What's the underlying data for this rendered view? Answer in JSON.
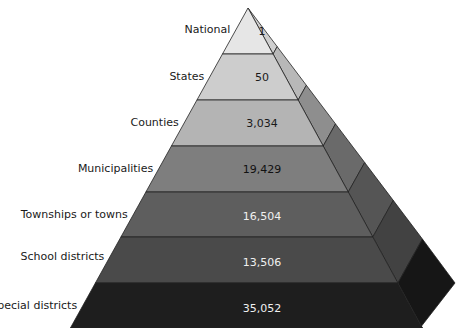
{
  "diagram": {
    "type": "pyramid",
    "levels": [
      {
        "label": "National",
        "value": "1",
        "fill": "#e6e6e6",
        "side": "#cfcfcf",
        "text": "#1a1a1a"
      },
      {
        "label": "States",
        "value": "50",
        "fill": "#cdcdcd",
        "side": "#b8b8b8",
        "text": "#1a1a1a"
      },
      {
        "label": "Counties",
        "value": "3,034",
        "fill": "#b4b4b4",
        "side": "#8e8e8e",
        "text": "#1a1a1a"
      },
      {
        "label": "Municipalities",
        "value": "19,429",
        "fill": "#7e7e7e",
        "side": "#6a6a6a",
        "text": "#111111"
      },
      {
        "label": "Townships or towns",
        "value": "16,504",
        "fill": "#5e5e5e",
        "side": "#555555",
        "text": "#f0f0f0"
      },
      {
        "label": "School districts",
        "value": "13,506",
        "fill": "#4a4a4a",
        "side": "#424242",
        "text": "#f0f0f0"
      },
      {
        "label": "Special districts",
        "value": "35,052",
        "fill": "#1e1e1e",
        "side": "#161616",
        "text": "#f0f0f0"
      }
    ]
  }
}
